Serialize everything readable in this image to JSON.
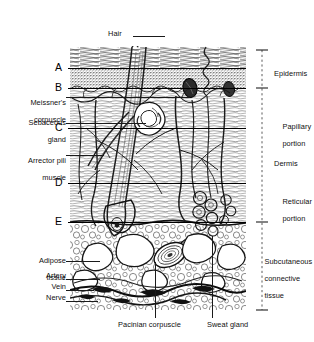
{
  "figure": {
    "background_color": "#ffffff",
    "ink_color": "#000000"
  },
  "top_label": {
    "text": "Hair",
    "name": "hair"
  },
  "letters": [
    {
      "id": "A",
      "text": "A",
      "y": 68
    },
    {
      "id": "B",
      "text": "B",
      "y": 88
    },
    {
      "id": "C",
      "text": "C",
      "y": 128
    },
    {
      "id": "D",
      "text": "D",
      "y": 183
    },
    {
      "id": "E",
      "text": "E",
      "y": 222
    }
  ],
  "left_labels": [
    {
      "id": "meissners-corpuscle",
      "line1": "Meissner's",
      "line2": "corpuscle",
      "y": 92
    },
    {
      "id": "sebaceous-gland",
      "line1": "Sebaceous",
      "line2": "gland",
      "y": 112
    },
    {
      "id": "arrector-pili-muscle",
      "line1": "Arrector pili",
      "line2": "muscle",
      "y": 150
    },
    {
      "id": "adipose-tissue",
      "line1": "Adipose",
      "line2": "tissue",
      "y": 250
    },
    {
      "id": "artery",
      "line1": "Artery",
      "line2": "",
      "y": 273
    },
    {
      "id": "vein",
      "line1": "Vein",
      "line2": "",
      "y": 284
    },
    {
      "id": "nerve",
      "line1": "Nerve",
      "line2": "",
      "y": 295
    }
  ],
  "right_labels": [
    {
      "id": "epidermis",
      "line1": "Epidermis",
      "line2": "",
      "line3": "",
      "y": 72
    },
    {
      "id": "papillary-portion",
      "line1": "Papillary",
      "line2": "portion",
      "line3": "",
      "y": 118
    },
    {
      "id": "dermis",
      "line1": "Dermis",
      "line2": "",
      "line3": "",
      "y": 163
    },
    {
      "id": "reticular-portion",
      "line1": "Reticular",
      "line2": "portion",
      "line3": "",
      "y": 193
    },
    {
      "id": "subcutaneous-connective-tissue",
      "line1": "Subcutaneous",
      "line2": "connective",
      "line3": "tissue",
      "y": 253
    }
  ],
  "bottom_labels": [
    {
      "id": "pacinian-corpuscle",
      "text": "Pacinian corpuscle",
      "x": 118,
      "y": 325
    },
    {
      "id": "sweat-gland",
      "text": "Sweat gland",
      "x": 207,
      "y": 325
    }
  ]
}
